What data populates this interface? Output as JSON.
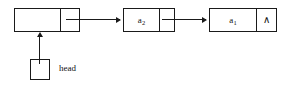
{
  "diagram": {
    "pointer": {
      "label": "head",
      "box_value": ""
    },
    "nodes": [
      {
        "id": "node-head-cell",
        "data_value": "",
        "data_sub": "",
        "link_value": "",
        "is_null": false
      },
      {
        "id": "node-a2",
        "data_value": "a",
        "data_sub": "2",
        "link_value": "",
        "is_null": false
      },
      {
        "id": "node-a1",
        "data_value": "a",
        "data_sub": "1",
        "link_value": "∧",
        "is_null": true
      }
    ],
    "colors": {
      "stroke": "#1a1a1a",
      "background": "#ffffff",
      "text": "#111111"
    }
  }
}
